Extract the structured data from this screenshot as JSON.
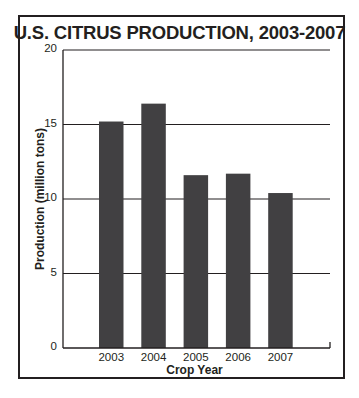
{
  "chart_data": {
    "type": "bar",
    "title": "U.S. CITRUS PRODUCTION, 2003-2007",
    "xlabel": "Crop Year",
    "ylabel": "Production (million tons)",
    "categories": [
      "2003",
      "2004",
      "2005",
      "2006",
      "2007"
    ],
    "values": [
      15.2,
      16.4,
      11.6,
      11.7,
      10.4
    ],
    "ylim": [
      0,
      20
    ],
    "yticks": [
      0,
      5,
      10,
      15,
      20
    ],
    "grid": true,
    "legend": null,
    "bar_color": "#414042"
  }
}
